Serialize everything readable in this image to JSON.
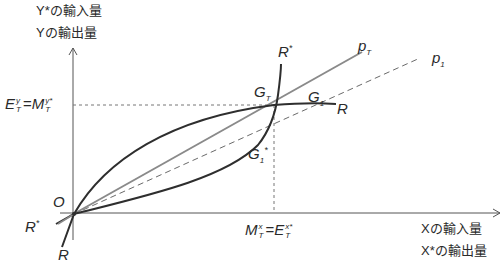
{
  "axes": {
    "y_label_line1": "Y*の輸入量",
    "y_label_line2": "Yの輸出量",
    "x_label_line1": "Xの輸入量",
    "x_label_line2": "X*の輸出量",
    "origin": "O"
  },
  "y_tick": {
    "left_symbol": "E",
    "left_sup": "y",
    "left_sub": "T",
    "equals": "=",
    "right_symbol": "M",
    "right_sup": "y*",
    "right_sub": "T"
  },
  "x_tick": {
    "left_symbol": "M",
    "left_sup": "x",
    "left_sub": "T",
    "equals": "=",
    "right_symbol": "E",
    "right_sup": "x*",
    "right_sub": "T"
  },
  "curves": {
    "R_star_top": {
      "symbol": "R",
      "sup": "*"
    },
    "R_star_bottom": {
      "symbol": "R",
      "sup": "*"
    },
    "R_right": {
      "symbol": "R"
    },
    "R_bottom": {
      "symbol": "R"
    }
  },
  "points": {
    "G_T": {
      "symbol": "G",
      "sub": "T"
    },
    "G_1": {
      "symbol": "G",
      "sub": "1"
    },
    "G_1_star": {
      "symbol": "G",
      "sub": "1",
      "sup": "*"
    }
  },
  "rays": {
    "p_T": {
      "symbol": "p",
      "sub": "T"
    },
    "p_1": {
      "symbol": "p",
      "sub": "1"
    }
  },
  "colors": {
    "curve": "#2e2e2e",
    "ray_pT": "#8a8a8a",
    "dashed": "#6a6a6a",
    "axis": "#555555"
  }
}
